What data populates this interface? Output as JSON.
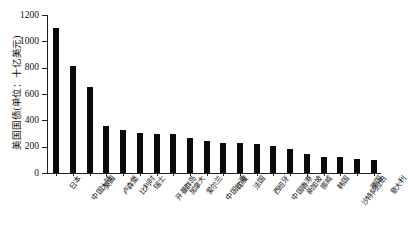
{
  "chart_data": {
    "type": "bar",
    "title": "",
    "subtitle": "",
    "xlabel": "",
    "ylabel": "美国国债(单位：十亿美元)",
    "ylim": [
      0,
      1200
    ],
    "yticks": [
      0,
      200,
      400,
      600,
      800,
      1000,
      1200
    ],
    "grid": false,
    "legend": null,
    "orientation": "vertical",
    "bar_color": "#0a0a0a",
    "categories": [
      "日本",
      "中国大陆",
      "英国",
      "卢森堡",
      "比利时",
      "瑞士",
      "开曼群岛",
      "加拿大",
      "爱尔兰",
      "中国台湾",
      "印度",
      "法国",
      "西班牙",
      "中国香港",
      "新加坡",
      "挪威",
      "韩国",
      "沙特阿拉伯",
      "德国",
      "意大利"
    ],
    "values": [
      1100,
      815,
      655,
      355,
      325,
      305,
      300,
      297,
      265,
      240,
      230,
      228,
      222,
      205,
      185,
      145,
      125,
      120,
      110,
      100
    ]
  }
}
